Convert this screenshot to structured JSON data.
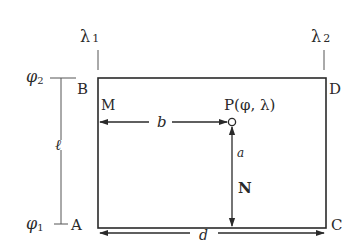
{
  "diagram": {
    "meridians": {
      "left": {
        "symbol": "λ",
        "sub": "1"
      },
      "right": {
        "symbol": "λ",
        "sub": "2"
      }
    },
    "parallels": {
      "top": {
        "symbol": "φ",
        "sub": "2"
      },
      "bottom": {
        "symbol": "φ",
        "sub": "1"
      }
    },
    "corners": {
      "top_left": "B",
      "top_right": "D",
      "bottom_left": "A",
      "bottom_right": "C"
    },
    "point_m": "M",
    "point_n": "N",
    "point_p": "P(φ,  λ)",
    "dimensions": {
      "b": "b",
      "a": "a",
      "d": "d",
      "l": "ℓ"
    },
    "colors": {
      "line": "#2a2a2a",
      "thin_line": "#555555",
      "background": "#ffffff"
    }
  }
}
